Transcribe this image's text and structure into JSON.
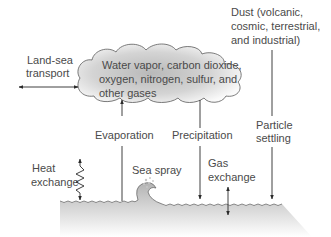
{
  "diagram": {
    "type": "atmosphere-ocean exchange diagram",
    "colors": {
      "text": "#4a4a4a",
      "line": "#2a2a2a",
      "cloud_center": "#bdbdbd",
      "cloud_edge": "#ffffff",
      "sea_top": "#b8b8b8",
      "sea_bottom": "#ffffff"
    },
    "cloud": {
      "label_lines": [
        "Water vapor, carbon dioxide,",
        "oxygen, nitrogen, sulfur, and",
        "other gases"
      ]
    },
    "labels": {
      "land_sea_transport": [
        "Land-sea",
        "transport"
      ],
      "dust": [
        "Dust (volcanic,",
        "cosmic, terrestrial,",
        "and industrial)"
      ],
      "evaporation": "Evaporation",
      "precipitation": "Precipitation",
      "particle_settling": [
        "Particle",
        "settling"
      ],
      "heat_exchange": [
        "Heat",
        "exchange"
      ],
      "sea_spray": "Sea spray",
      "gas_exchange": [
        "Gas",
        "exchange"
      ]
    },
    "arrows": [
      {
        "name": "land-sea-transport",
        "direction": "bidirectional-horizontal"
      },
      {
        "name": "evaporation",
        "direction": "up",
        "from": "sea",
        "to": "cloud"
      },
      {
        "name": "precipitation",
        "direction": "down",
        "from": "cloud",
        "to": "sea"
      },
      {
        "name": "particle-settling",
        "direction": "down",
        "from": "dust",
        "to": "sea"
      },
      {
        "name": "heat-exchange",
        "direction": "bidirectional-vertical",
        "style": "zigzag"
      },
      {
        "name": "gas-exchange",
        "direction": "bidirectional-vertical"
      }
    ]
  }
}
